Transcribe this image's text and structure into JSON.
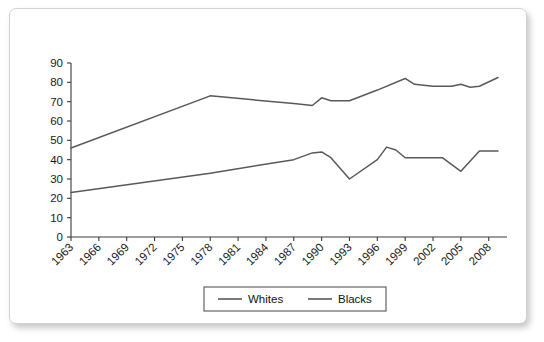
{
  "chart_data": {
    "type": "line",
    "title": "",
    "xlabel": "",
    "ylabel": "",
    "grid": false,
    "legend_position": "bottom-center",
    "ylim": [
      0,
      90
    ],
    "ytick_step": 10,
    "yticks": [
      "0",
      "10",
      "20",
      "30",
      "40",
      "50",
      "60",
      "70",
      "80",
      "90"
    ],
    "xlim": [
      1963,
      2009
    ],
    "xtick_step": 3,
    "categories": [
      "1963",
      "1966",
      "1969",
      "1972",
      "1975",
      "1978",
      "1981",
      "1984",
      "1987",
      "1990",
      "1993",
      "1996",
      "1999",
      "2002",
      "2005",
      "2008"
    ],
    "x": [
      1963,
      1978,
      1987,
      1989,
      1990,
      1991,
      1993,
      1996,
      1999,
      2000,
      2002,
      2004,
      2005,
      2006,
      2007,
      2009
    ],
    "series": [
      {
        "name": "Whites",
        "color": "#595959",
        "points": [
          [
            1963,
            46
          ],
          [
            1978,
            73
          ],
          [
            1987,
            69
          ],
          [
            1989,
            68
          ],
          [
            1990,
            72
          ],
          [
            1991,
            70.5
          ],
          [
            1993,
            70.5
          ],
          [
            1996,
            76
          ],
          [
            1999,
            82
          ],
          [
            2000,
            79
          ],
          [
            2002,
            78
          ],
          [
            2004,
            78
          ],
          [
            2005,
            79
          ],
          [
            2006,
            77.5
          ],
          [
            2007,
            78
          ],
          [
            2009,
            82.5
          ]
        ]
      },
      {
        "name": "Blacks",
        "color": "#595959",
        "points": [
          [
            1963,
            23
          ],
          [
            1978,
            33
          ],
          [
            1987,
            40
          ],
          [
            1989,
            43.5
          ],
          [
            1990,
            44
          ],
          [
            1991,
            41
          ],
          [
            1993,
            30
          ],
          [
            1996,
            40
          ],
          [
            1997,
            46.5
          ],
          [
            1998,
            45
          ],
          [
            1999,
            41
          ],
          [
            2002,
            41
          ],
          [
            2003,
            41
          ],
          [
            2005,
            34
          ],
          [
            2007,
            44.5
          ],
          [
            2009,
            44.5
          ]
        ]
      }
    ],
    "legend": [
      {
        "label": "Whites",
        "color": "#595959"
      },
      {
        "label": "Blacks",
        "color": "#595959"
      }
    ]
  }
}
